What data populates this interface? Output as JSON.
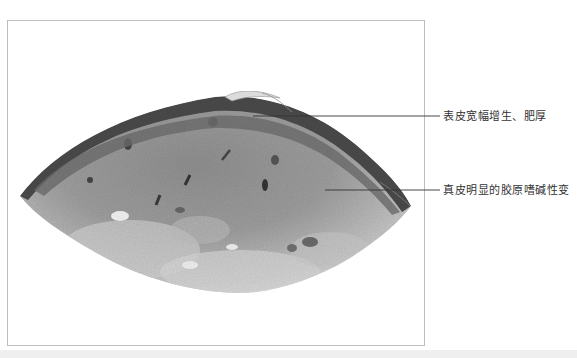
{
  "figure": {
    "type": "histology-micrograph",
    "stain": "grayscale H&E section",
    "annotations": [
      {
        "id": "epidermis",
        "label": "表皮宽幅增生、肥厚",
        "line_y": 116,
        "line_x_start": 253,
        "line_x_end": 440
      },
      {
        "id": "dermis",
        "label": "真皮明显的胶原嗜碱性变",
        "line_y": 190,
        "line_x_start": 325,
        "line_x_end": 440
      }
    ]
  },
  "colors": {
    "frame_border": "#bdbdbd",
    "leader_line": "#333333",
    "label_text": "#333333",
    "bottom_band": "#efefef"
  }
}
